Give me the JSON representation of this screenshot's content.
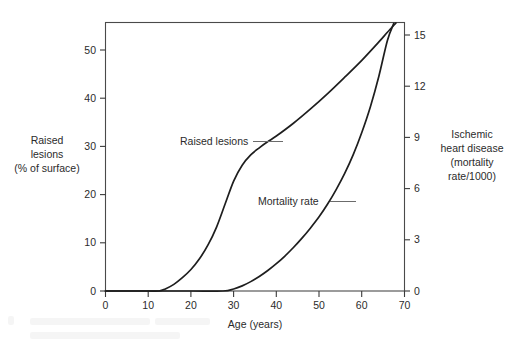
{
  "chart_data": {
    "type": "line",
    "title": "",
    "subtitle": "",
    "xlabel": "Age (years)",
    "ylabel": "Raised lesions (% of surface)",
    "y2label": "Ischemic heart disease (mortality rate/1000)",
    "grid": false,
    "legend": "none",
    "annotations": [
      "Raised lesions",
      "Mortality rate"
    ],
    "xlim": [
      0,
      70
    ],
    "ylim": [
      0,
      52.5
    ],
    "y2lim": [
      0,
      15.75
    ],
    "xticks": [
      0,
      10,
      20,
      30,
      40,
      50,
      60,
      70
    ],
    "xticklabels": [
      "0",
      "10",
      "20",
      "30",
      "40",
      "50",
      "60",
      "70"
    ],
    "yticks": [
      0,
      10,
      20,
      30,
      40,
      50
    ],
    "yticklabels": [
      "0",
      "10",
      "20",
      "30",
      "40",
      "50"
    ],
    "y2ticks": [
      0,
      3,
      6,
      9,
      12,
      15
    ],
    "y2ticklabels": [
      "0",
      "3",
      "6",
      "9",
      "12",
      "15"
    ],
    "series": [
      {
        "name": "Raised lesions",
        "axis": "left",
        "color": "#1e1e1e",
        "x": [
          0,
          5,
          10,
          12.5,
          14,
          16,
          18,
          20,
          22,
          24,
          26,
          28,
          30,
          32,
          34,
          36,
          38,
          40,
          44,
          48,
          52,
          56,
          60,
          64,
          66,
          68
        ],
        "y": [
          0,
          0,
          0,
          0,
          0.4,
          1.3,
          2.6,
          4.2,
          6.3,
          9.0,
          12.5,
          17.0,
          21.5,
          24.6,
          26.6,
          28.0,
          29.2,
          30.3,
          32.8,
          35.6,
          38.6,
          41.8,
          45.1,
          48.7,
          50.6,
          52.4
        ]
      },
      {
        "name": "Mortality rate",
        "axis": "right",
        "color": "#1e1e1e",
        "x": [
          0,
          10,
          20,
          27.5,
          30,
          32,
          34,
          36,
          38,
          40,
          42,
          44,
          46,
          48,
          50,
          52,
          54,
          56,
          58,
          60,
          62,
          64,
          66,
          67.5
        ],
        "y": [
          0,
          0,
          0,
          0,
          0.12,
          0.3,
          0.55,
          0.85,
          1.2,
          1.6,
          2.05,
          2.55,
          3.1,
          3.7,
          4.35,
          5.1,
          5.95,
          6.9,
          8.0,
          9.3,
          10.8,
          12.6,
          14.7,
          15.7
        ]
      }
    ]
  },
  "axes": {
    "x_title": "Age (years)",
    "y_left_title_lines": [
      "Raised",
      "lesions",
      "(% of surface)"
    ],
    "y_right_title_lines": [
      "Ischemic",
      "heart disease",
      "(mortality",
      "rate/1000)"
    ]
  },
  "annotations": {
    "raised_lesions": "Raised lesions",
    "mortality_rate": "Mortality rate"
  },
  "colors": {
    "background": "#ffffff",
    "curve": "#1e1e1e",
    "axis": "#3a3a3a",
    "text": "#2b2b2b",
    "leader": "#6b6b6b"
  }
}
